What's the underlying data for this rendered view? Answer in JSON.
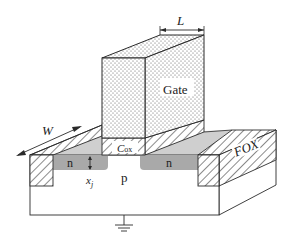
{
  "figure": {
    "labels": {
      "gate": "Gate",
      "length": "L",
      "width": "W",
      "oxide_capacitance": "C",
      "oxide_capacitance_sub": "ox",
      "source_region": "n",
      "drain_region": "n",
      "substrate": "p",
      "junction_depth": "x",
      "junction_depth_sub": "j",
      "field_oxide": "FOX"
    },
    "colors": {
      "line": "#2a2a2a",
      "n_region": "#a9a9a9",
      "gate_surface": "#bfbfbf",
      "stipple": "#444444",
      "background": "#ffffff"
    },
    "ground_symbol": "ground"
  }
}
